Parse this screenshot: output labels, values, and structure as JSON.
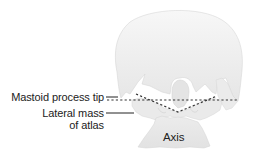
{
  "diagram": {
    "labels": {
      "mastoid_tip": "Mastoid process tip",
      "lateral_mass_line1": "Lateral mass",
      "lateral_mass_line2": "of atlas",
      "axis": "Axis"
    },
    "colors": {
      "bone_fill": "#ececec",
      "bone_fill_light": "#f6f6f6",
      "bone_edge": "#d2d2d2",
      "text": "#222222",
      "dashed_line": "#333333",
      "leader_line": "#222222"
    },
    "lines": {
      "horizontal_bimastoid": "dashed horizontal line through mastoid tips",
      "v_line": "dashed V-shaped line through lateral masses of atlas"
    }
  }
}
